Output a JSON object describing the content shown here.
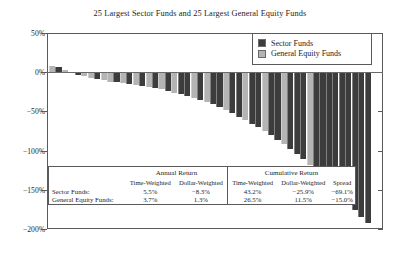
{
  "chart": {
    "title": "25 Largest Sector Funds and 25 Largest General Equity Funds"
  },
  "legend": {
    "position": "top-right",
    "items": [
      {
        "label": "Sector Funds",
        "color": "#3c3c3c",
        "key": "sector"
      },
      {
        "label": "General Equity Funds",
        "color": "#b4b4b4",
        "key": "general"
      }
    ]
  },
  "axis": {
    "y_ticks": [
      "50%",
      "0%",
      "−50%",
      "−100%",
      "−150%",
      "−200%"
    ],
    "y_tick_values": [
      50,
      0,
      -50,
      -100,
      -150,
      -200
    ]
  },
  "table": {
    "groups": [
      {
        "label": "Annual Return",
        "columns": [
          "Time-Weighted",
          "Dollar-Weighted"
        ]
      },
      {
        "label": "Cumulative Return",
        "columns": [
          "Time-Weighted",
          "Dollar-Weighted",
          "Spread"
        ]
      }
    ],
    "rows": [
      {
        "label": "Sector Funds:",
        "annual_time_weighted": "5.5%",
        "annual_dollar_weighted": "−8.3%",
        "cumulative_time_weighted": "43.2%",
        "cumulative_dollar_weighted": "−25.9%",
        "cumulative_spread": "−69.1%"
      },
      {
        "label": "General Equity Funds:",
        "annual_time_weighted": "3.7%",
        "annual_dollar_weighted": "1.3%",
        "cumulative_time_weighted": "26.5%",
        "cumulative_dollar_weighted": "11.5%",
        "cumulative_spread": "−15.0%"
      }
    ]
  },
  "chart_data": {
    "type": "bar",
    "title": "25 Largest Sector Funds and 25 Largest General Equity Funds",
    "xlabel": "",
    "ylabel": "",
    "ylim": [
      -200,
      50
    ],
    "grid": false,
    "ytick_labels": [
      "50%",
      "0%",
      "−50%",
      "−100%",
      "−150%",
      "−200%"
    ],
    "ytick_values": [
      50,
      0,
      -50,
      -100,
      -150,
      -200
    ],
    "legend_position": "upper right",
    "series_colors": {
      "sector": "#3c3c3c",
      "general": "#b4b4b4"
    },
    "categories": [
      "1",
      "2",
      "3",
      "4",
      "5",
      "6",
      "7",
      "8",
      "9",
      "10",
      "11",
      "12",
      "13",
      "14",
      "15",
      "16",
      "17",
      "18",
      "19",
      "20",
      "21",
      "22",
      "23",
      "24",
      "25",
      "26",
      "27",
      "28",
      "29",
      "30",
      "31",
      "32",
      "33",
      "34",
      "35",
      "36",
      "37",
      "38",
      "39",
      "40",
      "41",
      "42",
      "43",
      "44",
      "45",
      "46",
      "47",
      "48",
      "49",
      "50"
    ],
    "values": [
      8,
      6,
      3,
      -1,
      -3,
      -5,
      -7,
      -9,
      -10,
      -12,
      -13,
      -14,
      -15,
      -16,
      -18,
      -19,
      -20,
      -22,
      -24,
      -26,
      -28,
      -30,
      -33,
      -36,
      -38,
      -41,
      -44,
      -48,
      -52,
      -57,
      -61,
      -66,
      -70,
      -75,
      -80,
      -86,
      -92,
      -98,
      -104,
      -111,
      -118,
      -125,
      -133,
      -141,
      -150,
      -159,
      -168,
      -176,
      -185,
      -193
    ],
    "bar_groups": [
      "general",
      "sector",
      "general",
      "general",
      "sector",
      "general",
      "general",
      "sector",
      "general",
      "general",
      "sector",
      "general",
      "sector",
      "general",
      "sector",
      "general",
      "sector",
      "general",
      "sector",
      "general",
      "sector",
      "sector",
      "general",
      "sector",
      "general",
      "sector",
      "sector",
      "general",
      "sector",
      "sector",
      "general",
      "sector",
      "sector",
      "general",
      "sector",
      "sector",
      "general",
      "sector",
      "sector",
      "sector",
      "general",
      "sector",
      "sector",
      "sector",
      "sector",
      "sector",
      "sector",
      "sector",
      "sector",
      "sector"
    ]
  }
}
